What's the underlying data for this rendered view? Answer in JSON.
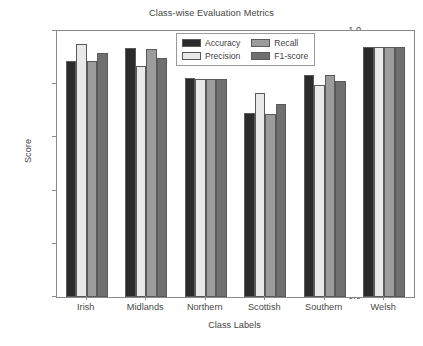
{
  "chart_data": {
    "type": "bar",
    "title": "Class-wise Evaluation Metrics",
    "xlabel": "Class Labels",
    "ylabel": "Score",
    "categories": [
      "Irish",
      "Midlands",
      "Northern",
      "Scottish",
      "Southern",
      "Welsh"
    ],
    "series": [
      {
        "name": "Accuracy",
        "color": "#2b2b2b",
        "values": [
          0.888,
          0.935,
          0.823,
          0.69,
          0.835,
          0.941
        ]
      },
      {
        "name": "Precision",
        "color": "#e9e9e9",
        "values": [
          0.952,
          0.87,
          0.819,
          0.768,
          0.797,
          0.941
        ]
      },
      {
        "name": "Recall",
        "color": "#9c9c9c",
        "values": [
          0.886,
          0.934,
          0.819,
          0.688,
          0.836,
          0.941
        ]
      },
      {
        "name": "F1-score",
        "color": "#707070",
        "values": [
          0.918,
          0.9,
          0.819,
          0.726,
          0.812,
          0.941
        ]
      }
    ],
    "ylim": [
      0.0,
      1.0
    ],
    "yticks": [
      "0.0",
      "0.2",
      "0.4",
      "0.6",
      "0.8",
      "1.0"
    ],
    "ytick_values": [
      0.0,
      0.2,
      0.4,
      0.6,
      0.8,
      1.0
    ],
    "grid": false,
    "legend_position": "upper center",
    "bar_edge_color": "#5a5a5a",
    "axes_color": "#8a8a8a"
  }
}
